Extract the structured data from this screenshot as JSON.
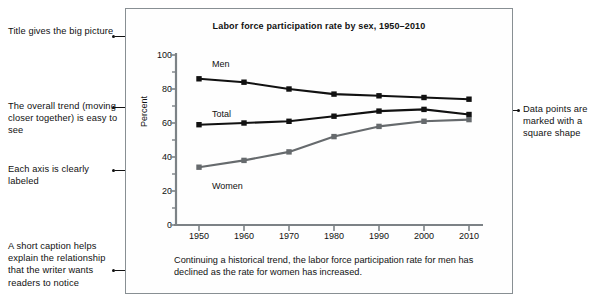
{
  "annotations": {
    "left": [
      {
        "id": "title-note",
        "text": "Title gives the big picture"
      },
      {
        "id": "trend-note",
        "text": "The overall trend (moving closer together) is easy to see"
      },
      {
        "id": "axis-note",
        "text": "Each axis is clearly labeled"
      },
      {
        "id": "caption-note",
        "text": "A short caption helps explain the relationship that the writer wants readers to notice"
      }
    ],
    "right": [
      {
        "id": "marker-note",
        "text": "Data points are marked with a square shape"
      }
    ]
  },
  "figure": {
    "caption": "Continuing a historical trend, the labor force participation rate for men has declined as the rate for women has increased."
  },
  "chart_data": {
    "type": "line",
    "title": "Labor force participation rate by sex, 1950–2010",
    "xlabel": "",
    "ylabel": "Percent",
    "categories": [
      "1950",
      "1960",
      "1970",
      "1980",
      "1990",
      "2000",
      "2010"
    ],
    "x": [
      1950,
      1960,
      1970,
      1980,
      1990,
      2000,
      2010
    ],
    "xlim": [
      1945,
      2015
    ],
    "ylim": [
      0,
      100
    ],
    "yticks": [
      0,
      20,
      40,
      60,
      80,
      100
    ],
    "yticks_minor": [
      10,
      30,
      50,
      70,
      90
    ],
    "grid": false,
    "legend": "inline-labels",
    "marker": "square",
    "series": [
      {
        "name": "Men",
        "color": "#111111",
        "values": [
          86,
          84,
          80,
          77,
          76,
          75,
          74
        ]
      },
      {
        "name": "Total",
        "color": "#111111",
        "values": [
          59,
          60,
          61,
          64,
          67,
          68,
          65
        ]
      },
      {
        "name": "Women",
        "color": "#666a6d",
        "values": [
          34,
          38,
          43,
          52,
          58,
          61,
          62
        ]
      }
    ]
  }
}
